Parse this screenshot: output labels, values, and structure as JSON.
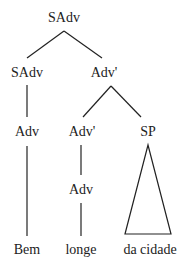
{
  "tree": {
    "root": "SAdv",
    "nodes": {
      "root": "SAdv",
      "left_sadv": "SAdv",
      "adv_bar": "Adv'",
      "adv_left": "Adv",
      "adv_bar_inner": "Adv'",
      "sp": "SP",
      "adv_mid": "Adv"
    },
    "leaves": {
      "bem": "Bem",
      "longe": "longe",
      "da_cidade": "da cidade"
    },
    "line_color": "#222222"
  }
}
